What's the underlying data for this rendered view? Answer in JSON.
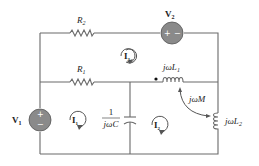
{
  "diagram": {
    "type": "circuit",
    "components": {
      "R2": {
        "label": "R",
        "sub": "2"
      },
      "R1": {
        "label": "R",
        "sub": "1"
      },
      "V2": {
        "label": "V",
        "sub": "2",
        "plus": "+",
        "minus": "−"
      },
      "V1": {
        "label": "V",
        "sub": "1",
        "plus": "+",
        "minus": "−"
      },
      "C": {
        "num": "1",
        "den": "jωC"
      },
      "L1": {
        "label": "jωL",
        "sub": "1"
      },
      "L2": {
        "label": "jωL",
        "sub": "2"
      },
      "M": {
        "label": "jωM"
      }
    },
    "mesh_currents": {
      "I1": {
        "label": "I",
        "sub": "1"
      },
      "I2": {
        "label": "I",
        "sub": "2"
      },
      "I3": {
        "label": "I",
        "sub": "3"
      }
    },
    "colors": {
      "wire": "#6a6a6a",
      "source_fill": "#8a8a8a",
      "text": "#222222"
    }
  }
}
